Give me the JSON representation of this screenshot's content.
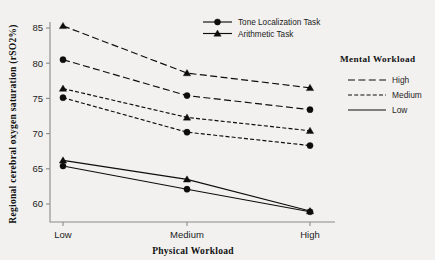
{
  "chart_data": {
    "type": "line",
    "title": "",
    "xlabel": "Physical Workload",
    "ylabel": "Regional cerebral oxygen saturation (rSO2%)",
    "categories": [
      "Low",
      "Medium",
      "High"
    ],
    "yticks": [
      60,
      65,
      70,
      75,
      80,
      85
    ],
    "ylim": [
      57.5,
      86.5
    ],
    "grid": false,
    "series": [
      {
        "name": "Arithmetic Task - High",
        "task": "Arithmetic Task",
        "workload": "High",
        "marker": "triangle",
        "dash": "long",
        "values": [
          85.3,
          78.6,
          76.5
        ]
      },
      {
        "name": "Tone Localization Task - High",
        "task": "Tone Localization Task",
        "workload": "High",
        "marker": "circle",
        "dash": "long",
        "values": [
          80.5,
          75.4,
          73.4
        ]
      },
      {
        "name": "Arithmetic Task - Medium",
        "task": "Arithmetic Task",
        "workload": "Medium",
        "marker": "triangle",
        "dash": "short",
        "values": [
          76.4,
          72.3,
          70.4
        ]
      },
      {
        "name": "Tone Localization Task - Medium",
        "task": "Tone Localization Task",
        "workload": "Medium",
        "marker": "circle",
        "dash": "short",
        "values": [
          75.1,
          70.2,
          68.3
        ]
      },
      {
        "name": "Arithmetic Task - Low",
        "task": "Arithmetic Task",
        "workload": "Low",
        "marker": "triangle",
        "dash": "solid",
        "values": [
          66.2,
          63.5,
          59.0
        ]
      },
      {
        "name": "Tone Localization Task - Low",
        "task": "Tone Localization Task",
        "workload": "Low",
        "marker": "circle",
        "dash": "solid",
        "values": [
          65.4,
          62.1,
          58.9
        ]
      }
    ],
    "legend_task": {
      "position": "top-center",
      "entries": [
        {
          "label": "Tone Localization Task",
          "marker": "circle"
        },
        {
          "label": "Arithmetic Task",
          "marker": "triangle"
        }
      ]
    },
    "legend_workload": {
      "position": "right",
      "title": "Mental Workload",
      "entries": [
        {
          "label": "High",
          "dash": "long"
        },
        {
          "label": "Medium",
          "dash": "short"
        },
        {
          "label": "Low",
          "dash": "solid"
        }
      ]
    },
    "colors": {
      "ink": "#0d0d0d",
      "axis": "#8a8a8a",
      "background": "#f2f1ef"
    }
  }
}
